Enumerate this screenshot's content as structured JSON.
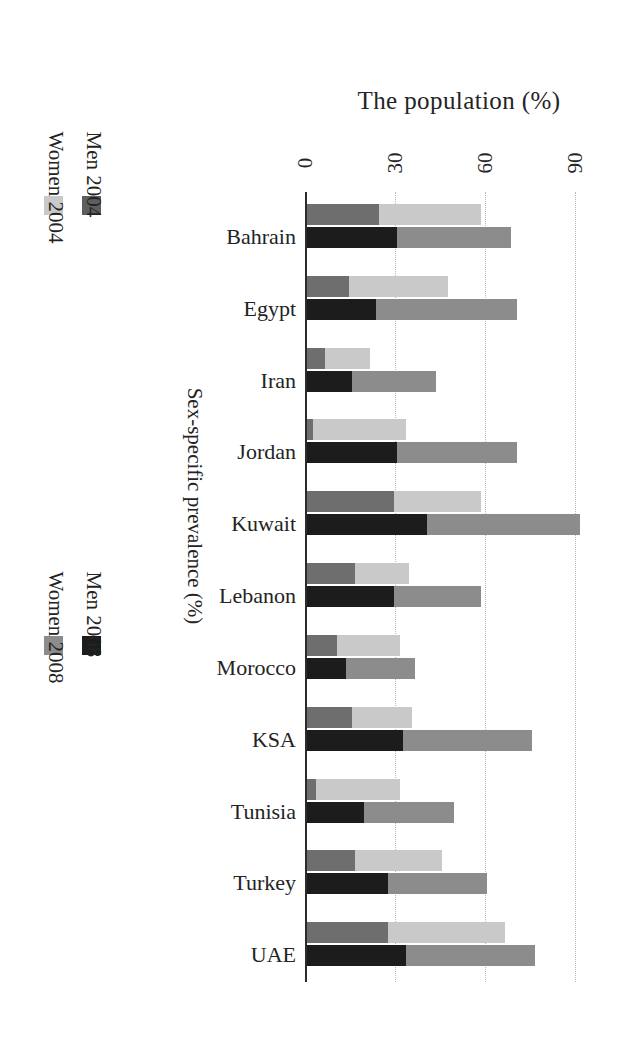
{
  "chart_data": {
    "type": "bar",
    "subtype": "grouped-stacked-horizontal",
    "orientation": "rotated-90-clockwise",
    "title": "The population (%)",
    "xlabel": "The population (%)",
    "ylabel": "Sex-specific prevalence (%)",
    "xlim": [
      0,
      100
    ],
    "ticks": [
      0,
      30,
      60,
      90
    ],
    "tick_labels": [
      "0",
      "30",
      "60",
      "90"
    ],
    "grid": "dotted vertical gridlines at 30, 60, 90",
    "legend_position": "left, two blocks",
    "categories": [
      "Bahrain",
      "Egypt",
      "Iran",
      "Jordan",
      "Kuwait",
      "Lebanon",
      "Morocco",
      "KSA",
      "Tunisia",
      "Turkey",
      "UAE"
    ],
    "series": [
      {
        "name": "Women 2004",
        "color": "#c9c9c9",
        "values": [
          58,
          47,
          21,
          33,
          58,
          34,
          31,
          35,
          31,
          45,
          66
        ]
      },
      {
        "name": "Men 2004",
        "color": "#6e6e6e",
        "values": [
          24,
          14,
          6,
          2,
          29,
          16,
          10,
          15,
          3,
          16,
          27
        ]
      },
      {
        "name": "Women 2008",
        "color": "#8c8c8c",
        "values": [
          68,
          70,
          43,
          70,
          91,
          58,
          36,
          75,
          49,
          60,
          76
        ]
      },
      {
        "name": "Men 2008",
        "color": "#1c1c1c",
        "values": [
          30,
          23,
          15,
          30,
          40,
          29,
          13,
          32,
          19,
          27,
          33
        ]
      }
    ]
  },
  "legends": [
    {
      "id": "legend-2004",
      "entries": [
        {
          "label": "Women 2004",
          "color": "#c9c9c9",
          "swatch": "light-gray-swatch"
        },
        {
          "label": "Men 2004",
          "color": "#5e5e5e",
          "swatch": "dark-gray-swatch"
        }
      ]
    },
    {
      "id": "legend-2008",
      "entries": [
        {
          "label": "Women 2008",
          "color": "#8c8c8c",
          "swatch": "medium-gray-swatch"
        },
        {
          "label": "Men 2008",
          "color": "#1c1c1c",
          "swatch": "black-swatch"
        }
      ]
    }
  ],
  "axis_title": "Sex-specific prevalence (%)",
  "colors": {
    "women_2004": "#c9c9c9",
    "men_2004": "#6e6e6e",
    "women_2008": "#8c8c8c",
    "men_2008": "#1c1c1c",
    "axis": "#2b2b2b",
    "grid": "#b8b8b8",
    "text": "#232323",
    "background": "#ffffff"
  }
}
